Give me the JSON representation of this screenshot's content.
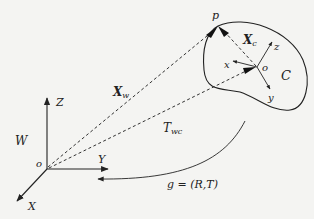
{
  "diagram": {
    "type": "coordinate-frame-transformation",
    "world_frame": {
      "name": "W",
      "origin_label": "o",
      "axes": {
        "x": "X",
        "y": "Y",
        "z": "Z"
      }
    },
    "camera_frame": {
      "name": "C",
      "origin_label": "o",
      "axes": {
        "x": "x",
        "y": "y",
        "z": "z"
      }
    },
    "point": {
      "label": "p"
    },
    "vectors": {
      "world_vector": {
        "main": "X",
        "sub": "w"
      },
      "camera_vector": {
        "main": "X",
        "sub": "c"
      }
    },
    "transform": {
      "main": "T",
      "sub": "wc",
      "equation": "g = (R,T)"
    },
    "colors": {
      "ink": "#222222",
      "background": "#f4f4f2"
    }
  }
}
